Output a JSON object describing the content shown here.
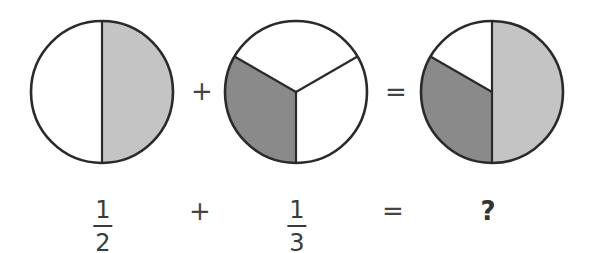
{
  "colors": {
    "outline": "#2a2a2a",
    "half_fill": "#c4c4c4",
    "third_fill": "#8a8a8a",
    "background": "#ffffff"
  },
  "pies": [
    {
      "name": "one-half",
      "center": [
        102,
        92
      ],
      "radius": 71,
      "slices": [
        {
          "fraction": "1/2",
          "fill": "#c4c4c4"
        }
      ]
    },
    {
      "name": "one-third",
      "center": [
        296,
        92
      ],
      "radius": 71,
      "slices": [
        {
          "fraction": "1/3",
          "fill": "#8a8a8a"
        }
      ]
    },
    {
      "name": "sum",
      "center": [
        492,
        92
      ],
      "radius": 71,
      "slices": [
        {
          "fraction": "1/2",
          "fill": "#c4c4c4"
        },
        {
          "fraction": "1/3",
          "fill": "#8a8a8a"
        }
      ]
    }
  ],
  "top_row": {
    "plus": "+",
    "equals": "="
  },
  "bottom_row": {
    "frac1": {
      "numerator": "1",
      "denominator": "2"
    },
    "plus": "+",
    "frac2": {
      "numerator": "1",
      "denominator": "3"
    },
    "equals": "=",
    "result": "?"
  }
}
